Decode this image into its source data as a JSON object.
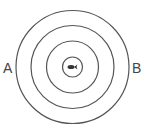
{
  "diagram": {
    "type": "concentric-circles",
    "center": {
      "x": 72.5,
      "y": 67
    },
    "rings": [
      {
        "radius": 57
      },
      {
        "radius": 42
      },
      {
        "radius": 26
      },
      {
        "radius": 10
      }
    ],
    "center_icon": "fish-icon",
    "labels": {
      "left": "A",
      "right": "B"
    },
    "colors": {
      "stroke": "#555555",
      "fill_center": "#333333",
      "background": "#ffffff"
    }
  }
}
